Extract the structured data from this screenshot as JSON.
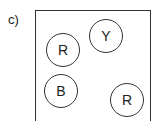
{
  "label": "c)",
  "circles": [
    {
      "letter": "R",
      "cx": 63,
      "cy": 50
    },
    {
      "letter": "Y",
      "cx": 106,
      "cy": 36
    },
    {
      "letter": "B",
      "cx": 61,
      "cy": 91
    },
    {
      "letter": "R",
      "cx": 127,
      "cy": 100
    }
  ]
}
